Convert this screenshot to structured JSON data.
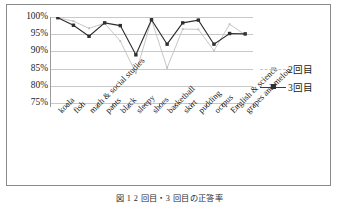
{
  "chart_data": {
    "type": "line",
    "title": "",
    "xlabel": "",
    "ylabel": "",
    "ylim": [
      75,
      100
    ],
    "ytick_labels": [
      "100%",
      "95%",
      "90%",
      "85%",
      "80%",
      "75%"
    ],
    "ytick_values": [
      100,
      95,
      90,
      85,
      80,
      75
    ],
    "grid": true,
    "legend_position": "right",
    "categories": [
      "koala",
      "fish",
      "math & social studies",
      "pants",
      "black",
      "sleepy",
      "shoes",
      "basketball",
      "skirt",
      "pudding",
      "octpus",
      "English & science",
      "grapes and melon"
    ],
    "series": [
      {
        "name": "2回目",
        "color": "#c0c0c0",
        "marker": "small-square",
        "values": [
          99.8,
          98.8,
          96.7,
          98.2,
          93.0,
          83.7,
          99.2,
          85.2,
          96.5,
          96.4,
          90.2,
          97.9,
          94.8
        ]
      },
      {
        "name": "3回目",
        "color": "#2f2f2f",
        "marker": "square",
        "values": [
          99.8,
          97.6,
          94.4,
          98.3,
          97.5,
          89.0,
          99.2,
          92.1,
          98.3,
          99.1,
          92.1,
          95.2,
          95.1
        ]
      }
    ]
  },
  "legend": {
    "entries": [
      {
        "label": "2回目"
      },
      {
        "label": "3回目"
      }
    ]
  },
  "caption": {
    "text": "図 1  2 回目・3 回目の正答率"
  },
  "colors": {
    "series_2": "#c0c0c0",
    "series_3": "#2f2f2f",
    "gridline": "#c9c9c9",
    "frame": "#8a8a8a",
    "text": "#1a1a1a"
  }
}
